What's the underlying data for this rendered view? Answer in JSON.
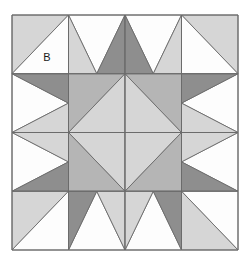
{
  "figure": {
    "kind": "pieced-quilt-block",
    "background_color": "#ffffff"
  },
  "palette": {
    "white": "#fdfdfd",
    "light_gray": "#d6d6d6",
    "medium_gray": "#b5b5b5",
    "dark_gray": "#8e8e8e",
    "outline": "#6b6b6b",
    "label_color": "#1a1a1a"
  },
  "block": {
    "origin_x": 12,
    "origin_y": 15,
    "width": 226,
    "height": 235,
    "grid_rows": 4,
    "grid_cols": 4,
    "cell_width": 56.5,
    "cell_height": 58.75,
    "outline_width": 1
  },
  "labels": [
    {
      "text": "B",
      "x": 47,
      "y": 58,
      "patch": "r0c0-lower-right-triangle"
    }
  ],
  "patches": [
    {
      "cell": "r0c0",
      "shape": "triangle",
      "points": "0,0 1,0 0,1",
      "fill": "light_gray"
    },
    {
      "cell": "r0c0",
      "shape": "triangle",
      "points": "1,0 1,1 0,1",
      "fill": "white"
    },
    {
      "cell": "r0c1",
      "shape": "triangle",
      "points": "0,0 1,0 0.5,1",
      "fill": "white"
    },
    {
      "cell": "r0c1",
      "shape": "triangle",
      "points": "1,0 1,1 0.5,1",
      "fill": "dark_gray"
    },
    {
      "cell": "r0c1",
      "shape": "triangle",
      "points": "0,0 0.5,1 0,1",
      "fill": "light_gray"
    },
    {
      "cell": "r0c2",
      "shape": "triangle",
      "points": "0,0 1,0 0.5,1",
      "fill": "white"
    },
    {
      "cell": "r0c2",
      "shape": "triangle",
      "points": "0,0 0.5,1 0,1",
      "fill": "dark_gray"
    },
    {
      "cell": "r0c2",
      "shape": "triangle",
      "points": "1,0 1,1 0.5,1",
      "fill": "light_gray"
    },
    {
      "cell": "r0c3",
      "shape": "triangle",
      "points": "0,0 1,0 1,1",
      "fill": "light_gray"
    },
    {
      "cell": "r0c3",
      "shape": "triangle",
      "points": "0,0 1,1 0,1",
      "fill": "white"
    },
    {
      "cell": "r1c0",
      "shape": "triangle",
      "points": "0,0 1,0.5 0,1",
      "fill": "white"
    },
    {
      "cell": "r1c0",
      "shape": "triangle",
      "points": "0,0 1,0 1,0.5",
      "fill": "dark_gray"
    },
    {
      "cell": "r1c0",
      "shape": "triangle",
      "points": "0,1 1,0.5 1,1",
      "fill": "light_gray"
    },
    {
      "cell": "r1c1",
      "shape": "triangle",
      "points": "0,0 1,0 0,1",
      "fill": "medium_gray"
    },
    {
      "cell": "r1c1",
      "shape": "triangle",
      "points": "1,0 1,1 0,1",
      "fill": "light_gray"
    },
    {
      "cell": "r1c2",
      "shape": "triangle",
      "points": "0,0 1,0 1,1",
      "fill": "medium_gray"
    },
    {
      "cell": "r1c2",
      "shape": "triangle",
      "points": "0,0 1,1 0,1",
      "fill": "light_gray"
    },
    {
      "cell": "r1c3",
      "shape": "triangle",
      "points": "1,0 1,1 0,0.5",
      "fill": "white"
    },
    {
      "cell": "r1c3",
      "shape": "triangle",
      "points": "0,0 1,0 0,0.5",
      "fill": "dark_gray"
    },
    {
      "cell": "r1c3",
      "shape": "triangle",
      "points": "0,0.5 1,1 0,1",
      "fill": "light_gray"
    },
    {
      "cell": "r2c0",
      "shape": "triangle",
      "points": "0,0 1,0.5 0,1",
      "fill": "white"
    },
    {
      "cell": "r2c0",
      "shape": "triangle",
      "points": "0,0 1,0 1,0.5",
      "fill": "light_gray"
    },
    {
      "cell": "r2c0",
      "shape": "triangle",
      "points": "0,1 1,0.5 1,1",
      "fill": "dark_gray"
    },
    {
      "cell": "r2c1",
      "shape": "triangle",
      "points": "0,0 1,0 1,1",
      "fill": "light_gray"
    },
    {
      "cell": "r2c1",
      "shape": "triangle",
      "points": "0,0 1,1 0,1",
      "fill": "medium_gray"
    },
    {
      "cell": "r2c2",
      "shape": "triangle",
      "points": "0,0 1,0 0,1",
      "fill": "light_gray"
    },
    {
      "cell": "r2c2",
      "shape": "triangle",
      "points": "1,0 1,1 0,1",
      "fill": "medium_gray"
    },
    {
      "cell": "r2c3",
      "shape": "triangle",
      "points": "1,0 1,1 0,0.5",
      "fill": "white"
    },
    {
      "cell": "r2c3",
      "shape": "triangle",
      "points": "0,0 1,0 0,0.5",
      "fill": "light_gray"
    },
    {
      "cell": "r2c3",
      "shape": "triangle",
      "points": "0,0.5 1,1 0,1",
      "fill": "dark_gray"
    },
    {
      "cell": "r3c0",
      "shape": "triangle",
      "points": "0,0 1,0 0,1",
      "fill": "light_gray"
    },
    {
      "cell": "r3c0",
      "shape": "triangle",
      "points": "1,0 1,1 0,1",
      "fill": "white"
    },
    {
      "cell": "r3c1",
      "shape": "triangle",
      "points": "0,1 1,1 0.5,0",
      "fill": "white"
    },
    {
      "cell": "r3c1",
      "shape": "triangle",
      "points": "1,0 1,1 0.5,0",
      "fill": "light_gray"
    },
    {
      "cell": "r3c1",
      "shape": "triangle",
      "points": "0,0 0.5,0 0,1",
      "fill": "dark_gray"
    },
    {
      "cell": "r3c2",
      "shape": "triangle",
      "points": "0,1 1,1 0.5,0",
      "fill": "white"
    },
    {
      "cell": "r3c2",
      "shape": "triangle",
      "points": "0,0 0.5,0 0,1",
      "fill": "light_gray"
    },
    {
      "cell": "r3c2",
      "shape": "triangle",
      "points": "1,0 1,1 0.5,0",
      "fill": "dark_gray"
    },
    {
      "cell": "r3c3",
      "shape": "triangle",
      "points": "0,0 1,0 1,1",
      "fill": "white"
    },
    {
      "cell": "r3c3",
      "shape": "triangle",
      "points": "0,0 1,1 0,1",
      "fill": "light_gray"
    }
  ],
  "grid_lines": {
    "vertical_fractions": [
      0,
      0.25,
      0.5,
      0.75,
      1
    ],
    "horizontal_fractions": [
      0,
      0.25,
      0.5,
      0.75,
      1
    ]
  }
}
